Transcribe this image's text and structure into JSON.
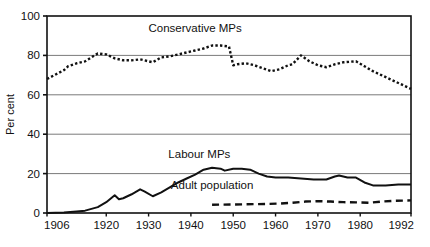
{
  "chart_data": {
    "type": "line",
    "title": "",
    "subtitle": "",
    "xlabel": "",
    "ylabel": "Per cent",
    "xlim": [
      1906,
      1992
    ],
    "ylim": [
      0,
      100
    ],
    "grid": true,
    "legend_position": "inline-annotations",
    "x_ticks": [
      1906,
      1920,
      1930,
      1940,
      1950,
      1960,
      1970,
      1980,
      1992
    ],
    "x_tick_labels": [
      "1906",
      "1920",
      "1930",
      "1940",
      "1950",
      "1960",
      "1970",
      "1980",
      "1992"
    ],
    "y_ticks": [
      0,
      20,
      40,
      60,
      80,
      100
    ],
    "y_tick_labels": [
      "0",
      "20",
      "40",
      "60",
      "80",
      "100"
    ],
    "series": [
      {
        "name": "Conservative MPs",
        "style": "dotted",
        "color": "#111111",
        "label_x": 1941,
        "label_y": 92,
        "points": [
          [
            1906,
            68.0
          ],
          [
            1910,
            72.5
          ],
          [
            1911,
            74.5
          ],
          [
            1913,
            76.0
          ],
          [
            1915,
            77.0
          ],
          [
            1918,
            81.0
          ],
          [
            1920,
            80.5
          ],
          [
            1922,
            78.5
          ],
          [
            1924,
            77.5
          ],
          [
            1926,
            77.5
          ],
          [
            1928,
            78.0
          ],
          [
            1929,
            77.5
          ],
          [
            1931,
            76.5
          ],
          [
            1933,
            79.0
          ],
          [
            1935,
            79.5
          ],
          [
            1937,
            80.5
          ],
          [
            1939,
            81.5
          ],
          [
            1941,
            82.5
          ],
          [
            1943,
            83.5
          ],
          [
            1945,
            85.0
          ],
          [
            1947,
            85.0
          ],
          [
            1949,
            84.5
          ],
          [
            1950,
            75.0
          ],
          [
            1951,
            75.5
          ],
          [
            1953,
            76.0
          ],
          [
            1955,
            75.0
          ],
          [
            1957,
            73.5
          ],
          [
            1959,
            72.0
          ],
          [
            1961,
            73.0
          ],
          [
            1963,
            75.0
          ],
          [
            1964,
            75.5
          ],
          [
            1966,
            80.0
          ],
          [
            1968,
            77.0
          ],
          [
            1970,
            75.0
          ],
          [
            1972,
            74.0
          ],
          [
            1974,
            75.5
          ],
          [
            1976,
            76.5
          ],
          [
            1979,
            77.0
          ],
          [
            1981,
            74.5
          ],
          [
            1983,
            72.0
          ],
          [
            1985,
            70.0
          ],
          [
            1987,
            68.0
          ],
          [
            1989,
            66.0
          ],
          [
            1992,
            63.0
          ]
        ]
      },
      {
        "name": "Labour MPs",
        "style": "solid",
        "color": "#111111",
        "label_x": 1942,
        "label_y": 28,
        "points": [
          [
            1906,
            0.0
          ],
          [
            1910,
            0.2
          ],
          [
            1913,
            0.8
          ],
          [
            1915,
            1.2
          ],
          [
            1918,
            3.0
          ],
          [
            1920,
            5.5
          ],
          [
            1922,
            9.0
          ],
          [
            1923,
            7.0
          ],
          [
            1924,
            7.5
          ],
          [
            1926,
            9.5
          ],
          [
            1928,
            12.0
          ],
          [
            1929,
            11.0
          ],
          [
            1931,
            8.5
          ],
          [
            1933,
            10.5
          ],
          [
            1935,
            13.0
          ],
          [
            1937,
            15.5
          ],
          [
            1939,
            17.5
          ],
          [
            1941,
            19.5
          ],
          [
            1943,
            22.0
          ],
          [
            1945,
            23.0
          ],
          [
            1947,
            22.5
          ],
          [
            1948,
            21.5
          ],
          [
            1950,
            22.5
          ],
          [
            1952,
            22.5
          ],
          [
            1954,
            22.0
          ],
          [
            1956,
            20.0
          ],
          [
            1958,
            18.5
          ],
          [
            1960,
            18.0
          ],
          [
            1963,
            18.0
          ],
          [
            1966,
            17.5
          ],
          [
            1969,
            17.0
          ],
          [
            1972,
            17.0
          ],
          [
            1974,
            18.5
          ],
          [
            1975,
            19.0
          ],
          [
            1977,
            18.0
          ],
          [
            1979,
            18.0
          ],
          [
            1981,
            15.5
          ],
          [
            1983,
            14.0
          ],
          [
            1986,
            14.0
          ],
          [
            1989,
            14.5
          ],
          [
            1992,
            14.5
          ]
        ]
      },
      {
        "name": "Adult population",
        "style": "dashed",
        "color": "#111111",
        "label_x": 1945,
        "label_y": 12,
        "points": [
          [
            1945,
            4.2
          ],
          [
            1950,
            4.3
          ],
          [
            1955,
            4.5
          ],
          [
            1958,
            4.6
          ],
          [
            1961,
            4.8
          ],
          [
            1964,
            5.2
          ],
          [
            1967,
            5.8
          ],
          [
            1970,
            6.0
          ],
          [
            1973,
            5.8
          ],
          [
            1976,
            5.5
          ],
          [
            1979,
            5.4
          ],
          [
            1982,
            5.2
          ],
          [
            1985,
            5.8
          ],
          [
            1988,
            6.2
          ],
          [
            1992,
            6.4
          ]
        ]
      }
    ]
  }
}
